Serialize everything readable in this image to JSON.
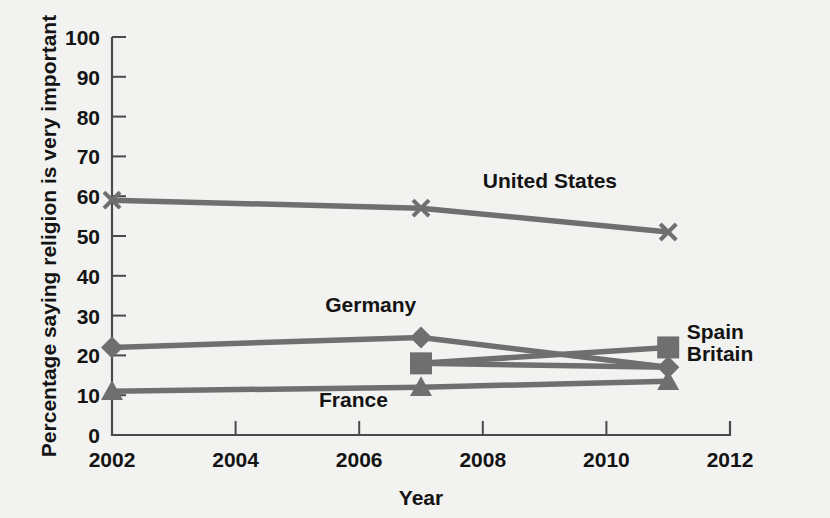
{
  "chart_data": {
    "type": "line",
    "title": "",
    "xlabel": "Year",
    "ylabel": "Percentage saying religion is very important",
    "xlim": [
      2002,
      2012
    ],
    "ylim": [
      0,
      100
    ],
    "xticks": [
      2002,
      2004,
      2006,
      2008,
      2010,
      2012
    ],
    "yticks": [
      0,
      10,
      20,
      30,
      40,
      50,
      60,
      70,
      80,
      90,
      100
    ],
    "grid": false,
    "legend_position": "inline-labels",
    "line_color": "#6f6f6f",
    "series": [
      {
        "name": "United States",
        "marker": "x",
        "x": [
          2002,
          2007,
          2011
        ],
        "values": [
          59,
          57,
          51
        ],
        "label_x": 2008.0,
        "label_y": 62,
        "label_anchor": "start"
      },
      {
        "name": "Germany",
        "marker": "diamond",
        "x": [
          2002,
          2007,
          2011
        ],
        "values": [
          22,
          24.5,
          17
        ],
        "label_x": 2005.45,
        "label_y": 31,
        "label_anchor": "start"
      },
      {
        "name": "Spain",
        "marker": "square",
        "x": [
          2007,
          2011
        ],
        "values": [
          18,
          22
        ],
        "label_x": 2011.3,
        "label_y": 24,
        "label_anchor": "start"
      },
      {
        "name": "Britain",
        "marker": "diamond",
        "x": [
          2007,
          2011
        ],
        "values": [
          18,
          17
        ],
        "label_x": 2011.3,
        "label_y": 18.5,
        "label_anchor": "start"
      },
      {
        "name": "France",
        "marker": "triangle",
        "x": [
          2002,
          2007,
          2011
        ],
        "values": [
          11,
          12,
          13.5
        ],
        "label_x": 2005.35,
        "label_y": 7,
        "label_anchor": "start"
      }
    ]
  },
  "axes": {
    "x_title": "Year",
    "y_title": "Percentage saying religion is very important",
    "x_tick_labels": [
      "2002",
      "2004",
      "2006",
      "2008",
      "2010",
      "2012"
    ],
    "y_tick_labels": [
      "0",
      "10",
      "20",
      "30",
      "40",
      "50",
      "60",
      "70",
      "80",
      "90",
      "100"
    ]
  },
  "labels": {
    "united_states": "United States",
    "germany": "Germany",
    "spain": "Spain",
    "britain": "Britain",
    "france": "France"
  }
}
